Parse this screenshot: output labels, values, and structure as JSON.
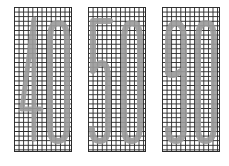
{
  "panels": [
    {
      "id": "panel-1",
      "value": "40",
      "digits": [
        "4",
        "0"
      ],
      "left": 14
    },
    {
      "id": "panel-2",
      "value": "50",
      "digits": [
        "5",
        "0"
      ],
      "left": 88
    },
    {
      "id": "panel-3",
      "value": "90",
      "digits": [
        "9",
        "0"
      ],
      "left": 162
    }
  ],
  "style": {
    "grid_color": "#2a2a2a",
    "digit_color": "#9a9a9a",
    "background": "#ffffff"
  }
}
